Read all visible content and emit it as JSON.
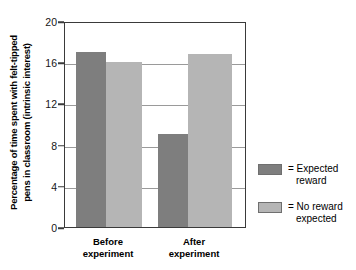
{
  "chart_data": {
    "type": "bar",
    "title": "",
    "xlabel": "",
    "ylabel_line1": "Percentage of time spent with felt-tipped",
    "ylabel_line2": "pens in classroom (intrinsic interest)",
    "categories": [
      "Before experiment",
      "After experiment"
    ],
    "category_labels": [
      {
        "line1": "Before",
        "line2": "experiment"
      },
      {
        "line1": "After",
        "line2": "experiment"
      }
    ],
    "series": [
      {
        "name": "Expected reward",
        "values": [
          17.0,
          9.0
        ],
        "color": "#7e7e7e"
      },
      {
        "name": "No reward expected",
        "values": [
          16.0,
          16.8
        ],
        "color": "#b5b5b5"
      }
    ],
    "ylim": [
      0,
      20
    ],
    "yticks": [
      0,
      4,
      8,
      12,
      16,
      20
    ],
    "ytick_labels": [
      "0",
      "4",
      "8",
      "12",
      "16",
      "20"
    ],
    "gridlines": [
      4,
      8,
      12,
      16
    ],
    "grid": true,
    "legend_position": "right",
    "legend": [
      {
        "swatch": "dark",
        "line1": "= Expected",
        "line2": "reward"
      },
      {
        "swatch": "light",
        "line1": "= No reward",
        "line2": "expected"
      }
    ]
  }
}
